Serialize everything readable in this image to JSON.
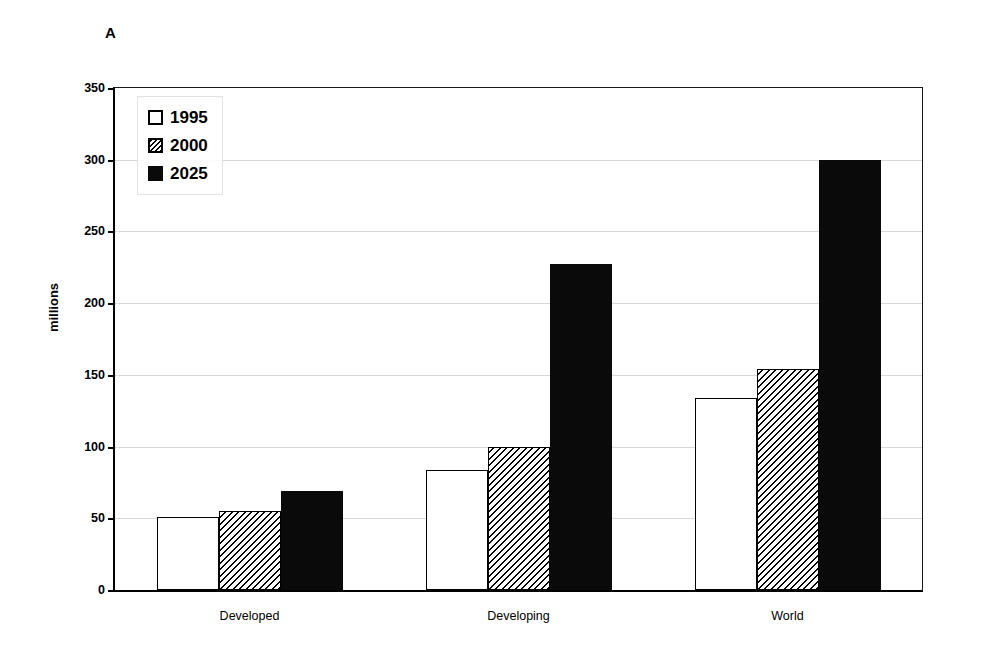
{
  "panel": {
    "letter": "A"
  },
  "chart_data": {
    "type": "bar",
    "title": "",
    "subtitle": "",
    "xlabel": "",
    "ylabel": "millions",
    "categories": [
      "Developed",
      "Developing",
      "World"
    ],
    "series": [
      {
        "name": "1995",
        "values": [
          51,
          84,
          134
        ],
        "fill": "white",
        "pattern": "none"
      },
      {
        "name": "2000",
        "values": [
          55,
          100,
          154
        ],
        "fill": "white",
        "pattern": "diagonal-hatch"
      },
      {
        "name": "2025",
        "values": [
          69,
          227,
          300
        ],
        "fill": "black",
        "pattern": "solid"
      }
    ],
    "ylim": [
      0,
      350
    ],
    "yticks": [
      0,
      50,
      100,
      150,
      200,
      250,
      300,
      350
    ],
    "ytick_labels": [
      "0",
      "50",
      "100",
      "150",
      "200",
      "250",
      "300",
      "350"
    ],
    "grid": true,
    "grid_axis": "y",
    "legend": {
      "position": "upper-left",
      "entries": [
        "1995",
        "2000",
        "2025"
      ]
    },
    "colors": {
      "foreground": "#000000",
      "background": "#ffffff",
      "grid": "#d8d8d8"
    }
  }
}
